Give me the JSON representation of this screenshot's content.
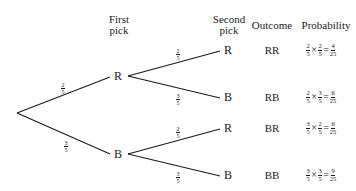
{
  "headers": {
    "first_pick": [
      "First",
      "pick"
    ],
    "second_pick": [
      "Second",
      "pick"
    ],
    "outcome": "Outcome",
    "probability": "Probability"
  },
  "first_level": [
    {
      "node": "R",
      "branch_prob": {
        "num": "2",
        "den": "5"
      }
    },
    {
      "node": "B",
      "branch_prob": {
        "num": "3",
        "den": "5"
      }
    }
  ],
  "second_level": [
    {
      "node": "R",
      "branch_prob": {
        "num": "2",
        "den": "5"
      }
    },
    {
      "node": "B",
      "branch_prob": {
        "num": "3",
        "den": "5"
      }
    },
    {
      "node": "R",
      "branch_prob": {
        "num": "2",
        "den": "5"
      }
    },
    {
      "node": "B",
      "branch_prob": {
        "num": "3",
        "den": "5"
      }
    }
  ],
  "outcomes": [
    {
      "label": "RR",
      "a": {
        "num": "2",
        "den": "5"
      },
      "b": {
        "num": "2",
        "den": "5"
      },
      "result": {
        "num": "4",
        "den": "25"
      }
    },
    {
      "label": "RB",
      "a": {
        "num": "2",
        "den": "5"
      },
      "b": {
        "num": "3",
        "den": "5"
      },
      "result": {
        "num": "6",
        "den": "25"
      }
    },
    {
      "label": "BR",
      "a": {
        "num": "3",
        "den": "5"
      },
      "b": {
        "num": "2",
        "den": "5"
      },
      "result": {
        "num": "6",
        "den": "25"
      }
    },
    {
      "label": "BB",
      "a": {
        "num": "3",
        "den": "5"
      },
      "b": {
        "num": "3",
        "den": "5"
      },
      "result": {
        "num": "9",
        "den": "25"
      }
    }
  ],
  "symbols": {
    "times": "×",
    "equals": "="
  }
}
